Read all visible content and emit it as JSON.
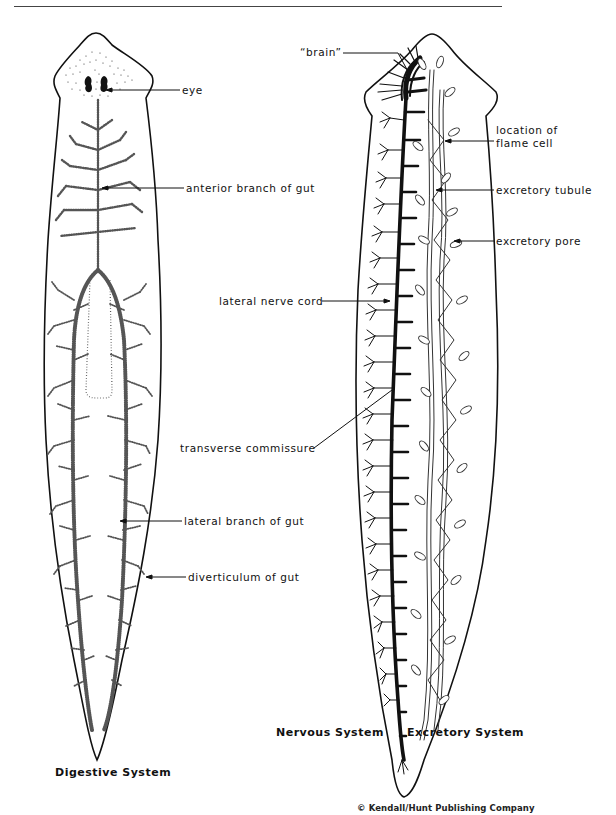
{
  "figure": {
    "panels": [
      {
        "id": "digestive",
        "caption": "Digestive System"
      },
      {
        "id": "nervous",
        "caption": "Nervous System"
      },
      {
        "id": "excretory",
        "caption": "Excretory System"
      }
    ],
    "labels": {
      "eye": "eye",
      "anterior_branch": "anterior branch of gut",
      "lateral_branch": "lateral branch of gut",
      "diverticulum": "diverticulum of gut",
      "brain": "“brain”",
      "flame_cell_line1": "location of",
      "flame_cell_line2": "flame cell",
      "excretory_tubule": "excretory tubule",
      "excretory_pore": "excretory pore",
      "lateral_nerve_cord": "lateral nerve cord",
      "transverse_commissure": "transverse commissure"
    },
    "credit": "© Kendall/Hunt Publishing Company",
    "colors": {
      "ink": "#111111",
      "background": "#ffffff"
    }
  }
}
